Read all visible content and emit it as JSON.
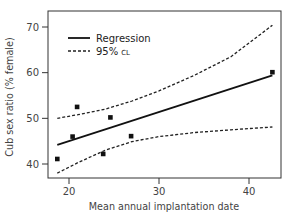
{
  "chart_data": {
    "type": "scatter",
    "title": "",
    "xlabel": "Mean annual implantation date",
    "ylabel": "Cub sex ratio (% female)",
    "xlim": [
      16.5,
      44
    ],
    "ylim": [
      37,
      73
    ],
    "xticks": [
      20,
      30,
      40
    ],
    "yticks": [
      40,
      50,
      60,
      70
    ],
    "grid": false,
    "legend_position": "upper left",
    "legend": [
      {
        "label": "Regression",
        "style": "solid"
      },
      {
        "label_main": "95%",
        "label_small": "CL",
        "style": "dashed"
      }
    ],
    "points": [
      {
        "x": 18.7,
        "y": 41.1
      },
      {
        "x": 20.4,
        "y": 46.0
      },
      {
        "x": 20.9,
        "y": 52.5
      },
      {
        "x": 23.8,
        "y": 42.2
      },
      {
        "x": 24.6,
        "y": 50.2
      },
      {
        "x": 26.9,
        "y": 46.1
      },
      {
        "x": 42.6,
        "y": 60.1
      }
    ],
    "series": [
      {
        "name": "Regression",
        "style": "solid",
        "x": [
          18.7,
          42.6
        ],
        "y": [
          44.2,
          59.4
        ]
      },
      {
        "name": "95% CL upper",
        "style": "dashed",
        "x": [
          18.7,
          21,
          24,
          27,
          30,
          34,
          38,
          42.6
        ],
        "y": [
          50.0,
          50.8,
          52.0,
          53.8,
          56.0,
          59.5,
          63.5,
          70.4
        ]
      },
      {
        "name": "95% CL lower",
        "style": "dashed",
        "x": [
          18.7,
          21,
          24,
          27,
          30,
          34,
          38,
          42.6
        ],
        "y": [
          38.0,
          40.3,
          43.0,
          44.9,
          46.0,
          46.9,
          47.5,
          48.1
        ]
      }
    ]
  },
  "labels": {
    "xlabel": "Mean annual implantation date",
    "ylabel": "Cub sex ratio (% female)",
    "yticks": [
      "40",
      "50",
      "60",
      "70"
    ],
    "xticks": [
      "20",
      "30",
      "40"
    ],
    "legend_regression": "Regression",
    "legend_ci_main": "95%",
    "legend_ci_small": "CL"
  }
}
